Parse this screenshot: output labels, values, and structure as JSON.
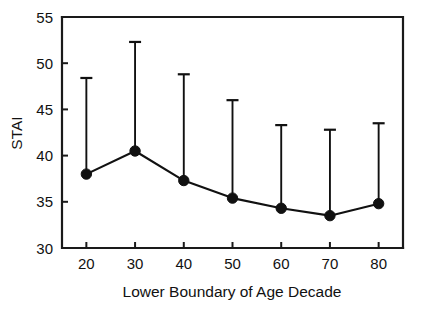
{
  "chart_data": {
    "type": "line",
    "title": "",
    "xlabel": "Lower Boundary of Age Decade",
    "ylabel": "STAI",
    "categories": [
      "20",
      "30",
      "40",
      "50",
      "60",
      "70",
      "80"
    ],
    "x": [
      20,
      30,
      40,
      50,
      60,
      70,
      80
    ],
    "values": [
      38.0,
      40.5,
      37.3,
      35.4,
      34.3,
      33.5,
      34.8
    ],
    "error_upper": [
      48.4,
      52.3,
      48.8,
      46.0,
      43.3,
      42.8,
      43.5
    ],
    "xlim": [
      15,
      85
    ],
    "ylim": [
      30,
      55
    ],
    "yticks": [
      30,
      35,
      40,
      45,
      50,
      55
    ],
    "ytick_labels": [
      "30",
      "35",
      "40",
      "45",
      "50",
      "55"
    ],
    "xticks": [
      20,
      30,
      40,
      50,
      60,
      70,
      80
    ],
    "xtick_labels": [
      "20",
      "30",
      "40",
      "50",
      "60",
      "70",
      "80"
    ],
    "grid": false,
    "legend": null,
    "marker": "filled-circle",
    "error_bar_style": "upper-only-with-cap",
    "colors": {
      "line": "#111111",
      "marker": "#111111",
      "axis": "#1a1a1a",
      "background": "#ffffff"
    }
  }
}
